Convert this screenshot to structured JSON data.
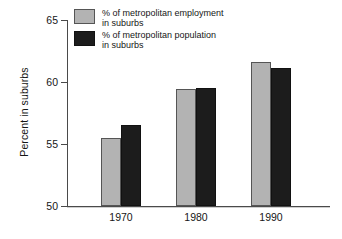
{
  "chart_data": {
    "type": "bar",
    "title": "",
    "subtitle": "",
    "xlabel": "",
    "ylabel": "Percent in suburbs",
    "categories": [
      "1970",
      "1980",
      "1990"
    ],
    "series": [
      {
        "name": "% of metropolitan employment in suburbs",
        "legend_line1": "% of metropolitan employment",
        "legend_line2": "in suburbs",
        "color": "#b3b3b3",
        "values": [
          55.5,
          59.4,
          61.6
        ]
      },
      {
        "name": "% of metropolitan population in suburbs",
        "legend_line1": "% of metropolitan population",
        "legend_line2": "in suburbs",
        "color": "#1c1c1c",
        "values": [
          56.5,
          59.5,
          61.1
        ]
      }
    ],
    "ylim": [
      50,
      65
    ],
    "yticks": [
      "50",
      "55",
      "60",
      "65"
    ],
    "ytick_values": [
      50,
      55,
      60,
      65
    ],
    "xticks": [
      "1970",
      "1980",
      "1990"
    ],
    "grid": false,
    "legend_position": "top-left-inside"
  },
  "axes": {
    "y_title": "Percent in suburbs",
    "y_tick_labels": [
      "65",
      "60",
      "55",
      "50"
    ],
    "x_tick_labels": [
      "1970",
      "1980",
      "1990"
    ]
  },
  "legend": {
    "items": [
      {
        "swatch": "gray-swatch",
        "line1": "% of metropolitan employment",
        "line2": "in suburbs"
      },
      {
        "swatch": "black-swatch",
        "line1": "% of metropolitan population",
        "line2": "in suburbs"
      }
    ]
  },
  "colors": {
    "employment": "#b3b3b3",
    "population": "#1c1c1c",
    "axis": "#4a4a4a",
    "text": "#161616",
    "background": "#ffffff"
  }
}
